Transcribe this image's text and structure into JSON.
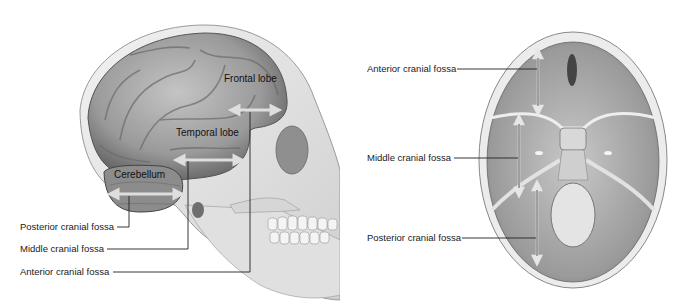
{
  "figure": {
    "left_panel": {
      "view": "lateral view of skull with brain",
      "structure_labels": {
        "frontal_lobe": "Frontal lobe",
        "temporal_lobe": "Temporal lobe",
        "cerebellum": "Cerebellum"
      },
      "callouts": {
        "posterior": "Posterior cranial fossa",
        "middle": "Middle cranial fossa",
        "anterior": "Anterior cranial fossa"
      }
    },
    "right_panel": {
      "view": "superior view of cranial base",
      "callouts": {
        "anterior": "Anterior cranial fossa",
        "middle": "Middle cranial fossa",
        "posterior": "Posterior cranial fossa"
      }
    },
    "colors": {
      "bone": "#e6e6e6",
      "bone_shadow": "#9a9a9a",
      "brain": "#a8a8a8",
      "brain_dark": "#6e6e6e",
      "arrow": "#d8d8d8",
      "leader_line": "#222222"
    }
  }
}
